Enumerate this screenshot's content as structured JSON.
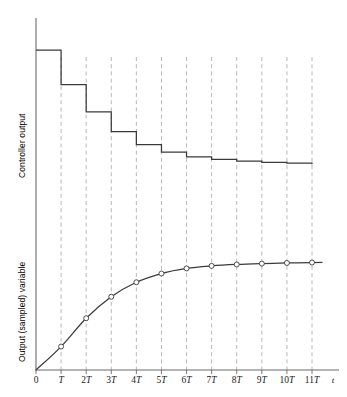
{
  "figure": {
    "background_color": "#ffffff",
    "axis_color": "#6b6b6b",
    "trace_color": "#3a3a3a",
    "grid_color": "#b0b0b0",
    "marker_fill": "#ffffff"
  },
  "axes": {
    "y_top_label": "Controller output",
    "y_bottom_label": "Output (sampled) variable",
    "x_axis_name": "t",
    "x_tick_labels": [
      "0",
      "T",
      "2T",
      "3T",
      "4T",
      "5T",
      "6T",
      "7T",
      "8T",
      "9T",
      "10T",
      "11T"
    ]
  },
  "chart_data": {
    "type": "line",
    "title": "",
    "xlabel": "t",
    "ylabel": "",
    "grid": true,
    "legend": "none",
    "x": [
      0,
      1,
      2,
      3,
      4,
      5,
      6,
      7,
      8,
      9,
      10,
      11,
      12
    ],
    "x_tick_labels": [
      "0",
      "T",
      "2T",
      "3T",
      "4T",
      "5T",
      "6T",
      "7T",
      "8T",
      "9T",
      "10T",
      "11T"
    ],
    "xlim": [
      0,
      12
    ],
    "series": [
      {
        "name": "Controller output",
        "type": "step",
        "panel": "top",
        "ylabel": "Controller output",
        "ylim": [
          0,
          1.25
        ],
        "step_style": "post",
        "x": [
          0,
          1,
          2,
          3,
          4,
          5,
          6,
          7,
          8,
          9,
          10,
          11,
          12
        ],
        "values": [
          1.0,
          0.745,
          0.545,
          0.4,
          0.305,
          0.25,
          0.215,
          0.195,
          0.182,
          0.174,
          0.168,
          0.164,
          0.164
        ]
      },
      {
        "name": "Output (sampled) variable",
        "type": "line",
        "panel": "bottom",
        "ylabel": "Output (sampled) variable",
        "ylim": [
          0,
          1.15
        ],
        "markers": "open-circle",
        "marker_x": [
          1,
          2,
          3,
          4,
          5,
          6,
          7,
          8,
          9,
          10,
          11
        ],
        "x": [
          0,
          1,
          2,
          3,
          4,
          5,
          6,
          7,
          8,
          9,
          10,
          11,
          12
        ],
        "values": [
          0.0,
          0.215,
          0.475,
          0.672,
          0.805,
          0.885,
          0.932,
          0.955,
          0.968,
          0.976,
          0.982,
          0.986,
          0.988
        ]
      }
    ]
  }
}
